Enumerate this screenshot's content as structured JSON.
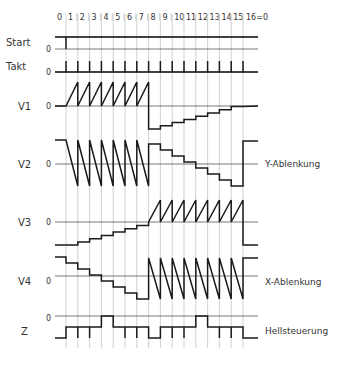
{
  "diagram": {
    "column_labels": [
      "0",
      "1",
      "2",
      "3",
      "4",
      "5",
      "6",
      "7",
      "8",
      "9",
      "10",
      "11",
      "12",
      "13",
      "14",
      "15",
      "16=0"
    ],
    "zero_label": "0",
    "signals": [
      {
        "name": "Start",
        "annotation": ""
      },
      {
        "name": "Takt",
        "annotation": ""
      },
      {
        "name": "V1",
        "annotation": ""
      },
      {
        "name": "V2",
        "annotation": "Y-Ablenkung"
      },
      {
        "name": "V3",
        "annotation": ""
      },
      {
        "name": "V4",
        "annotation": "X-Ablenkung"
      },
      {
        "name": "Z",
        "annotation": "Hellsteuerung"
      }
    ],
    "colors": {
      "trace": "#1a1a1a",
      "grid": "#bdbdbd",
      "text": "#333333",
      "background": "#ffffff"
    }
  }
}
